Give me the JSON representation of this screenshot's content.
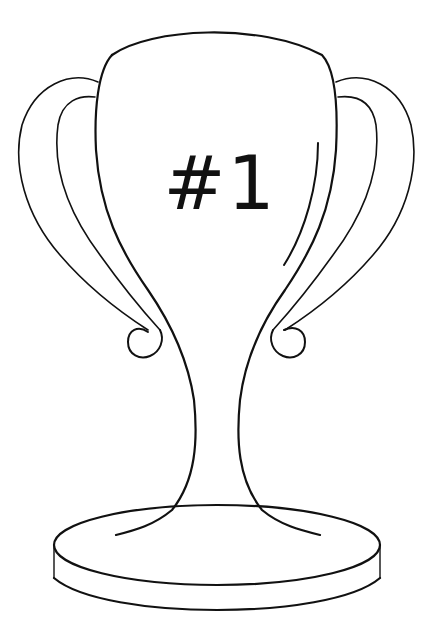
{
  "illustration": {
    "subject": "trophy-cup-outline",
    "label_text": "#1",
    "colors": {
      "background": "#ffffff",
      "stroke": "#111111"
    }
  }
}
